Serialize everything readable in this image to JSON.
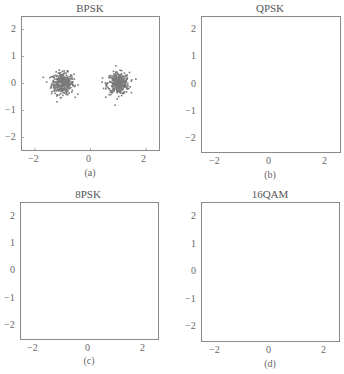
{
  "figure": {
    "background": "#ffffff",
    "point_color": "#7a7a7a",
    "frame_color": "#8a8a8a",
    "text_color": "#555555"
  },
  "chart_data": [
    {
      "type": "scatter",
      "title": "BPSK",
      "caption": "(a)",
      "xlabel": "",
      "ylabel": "",
      "xlim": [
        -2.5,
        2.5
      ],
      "ylim": [
        -2.5,
        2.5
      ],
      "xticks": [
        "-2",
        "0",
        "2"
      ],
      "yticks": [
        "2",
        "1",
        "0",
        "-1",
        "-2"
      ],
      "grid": false,
      "legend": null,
      "constellation_points": [
        [
          -1,
          0
        ],
        [
          1,
          0
        ]
      ],
      "noise_std": 0.2,
      "approx_points_per_cluster": 350,
      "series": [
        {
          "name": "received symbols",
          "cluster_centers": [
            [
              -1,
              0
            ],
            [
              1,
              0
            ]
          ]
        }
      ]
    },
    {
      "type": "scatter",
      "title": "QPSK",
      "caption": "(b)",
      "xlabel": "",
      "ylabel": "",
      "xlim": [
        -2.5,
        2.5
      ],
      "ylim": [
        -2.5,
        2.5
      ],
      "xticks": [
        "-2",
        "0",
        "2"
      ],
      "yticks": [
        "2",
        "1",
        "0",
        "-1",
        "-2"
      ],
      "grid": false,
      "legend": null,
      "constellation_points": [
        [
          0,
          1
        ],
        [
          -1,
          0
        ],
        [
          1,
          0
        ],
        [
          0,
          -1
        ]
      ],
      "noise_std": 0.2,
      "approx_points_per_cluster": 220,
      "series": [
        {
          "name": "received symbols",
          "cluster_centers": [
            [
              0,
              1
            ],
            [
              -1,
              0
            ],
            [
              1,
              0
            ],
            [
              0,
              -1
            ]
          ]
        }
      ]
    },
    {
      "type": "scatter",
      "title": "8PSK",
      "caption": "(c)",
      "xlabel": "",
      "ylabel": "",
      "xlim": [
        -2.5,
        2.5
      ],
      "ylim": [
        -2.5,
        2.5
      ],
      "xticks": [
        "-2",
        "0",
        "2"
      ],
      "yticks": [
        "2",
        "1",
        "0",
        "-1",
        "-2"
      ],
      "grid": false,
      "legend": null,
      "constellation_points": [
        [
          1,
          0
        ],
        [
          0.707,
          0.707
        ],
        [
          0,
          1
        ],
        [
          -0.707,
          0.707
        ],
        [
          -1,
          0
        ],
        [
          -0.707,
          -0.707
        ],
        [
          0,
          -1
        ],
        [
          0.707,
          -0.707
        ]
      ],
      "noise_std": 0.2,
      "approx_points_per_cluster": 110,
      "series": [
        {
          "name": "received symbols",
          "shape": "ring",
          "radius": 1
        }
      ]
    },
    {
      "type": "scatter",
      "title": "16QAM",
      "caption": "(d)",
      "xlabel": "",
      "ylabel": "",
      "xlim": [
        -2.5,
        2.5
      ],
      "ylim": [
        -2.5,
        2.5
      ],
      "xticks": [
        "-2",
        "0",
        "2"
      ],
      "yticks": [
        "2",
        "1",
        "0",
        "-1",
        "-2"
      ],
      "grid": false,
      "legend": null,
      "constellation_points": [
        [
          -1,
          1
        ],
        [
          -0.33,
          1
        ],
        [
          0.33,
          1
        ],
        [
          1,
          1
        ],
        [
          -1,
          0.33
        ],
        [
          -0.33,
          0.33
        ],
        [
          0.33,
          0.33
        ],
        [
          1,
          0.33
        ],
        [
          -1,
          -0.33
        ],
        [
          -0.33,
          -0.33
        ],
        [
          0.33,
          -0.33
        ],
        [
          1,
          -0.33
        ],
        [
          -1,
          -1
        ],
        [
          -0.33,
          -1
        ],
        [
          0.33,
          -1
        ],
        [
          1,
          -1
        ]
      ],
      "noise_std": 0.2,
      "approx_points_per_cluster": 55,
      "series": [
        {
          "name": "received symbols",
          "shape": "square",
          "extent": [
            -1.3,
            1.3
          ]
        }
      ]
    }
  ],
  "panels": [
    {
      "title": "BPSK",
      "caption": "(a)",
      "x_ticks": [
        "−2",
        "0",
        "2"
      ],
      "y_ticks": [
        "2",
        "1",
        "0",
        "−1",
        "−2"
      ]
    },
    {
      "title": "QPSK",
      "caption": "(b)",
      "x_ticks": [
        "−2",
        "0",
        "2"
      ],
      "y_ticks": [
        "2",
        "1",
        "0",
        "−1",
        "−2"
      ]
    },
    {
      "title": "8PSK",
      "caption": "(c)",
      "x_ticks": [
        "−2",
        "0",
        "2"
      ],
      "y_ticks": [
        "2",
        "1",
        "0",
        "−1",
        "−2"
      ]
    },
    {
      "title": "16QAM",
      "caption": "(d)",
      "x_ticks": [
        "−2",
        "0",
        "2"
      ],
      "y_ticks": [
        "2",
        "1",
        "0",
        "−1",
        "−2"
      ]
    }
  ]
}
